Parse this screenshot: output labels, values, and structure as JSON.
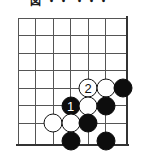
{
  "diagram": {
    "kind": "go-board-problem-diagram",
    "caption": "図 ・・ ・・・",
    "board": {
      "columns": 7,
      "rows": 8,
      "cell_size": 17.5,
      "origin_x": 18,
      "origin_y": 10,
      "line_color": "#555555",
      "edge_color": "#333333",
      "background": "#ffffff"
    },
    "colors": {
      "black_stone": "#0d0d0d",
      "white_stone": "#ffffff",
      "stone_outline": "#111111",
      "black_label_text": "#ffffff",
      "white_label_text": "#111111"
    },
    "stones": [
      {
        "name": "white-move-2",
        "color": "white",
        "col": 4,
        "row": 4,
        "label": "2"
      },
      {
        "name": "white-stone-c5r4",
        "color": "white",
        "col": 5,
        "row": 4,
        "label": ""
      },
      {
        "name": "black-stone-c6r4",
        "color": "black",
        "col": 6,
        "row": 4,
        "label": ""
      },
      {
        "name": "black-move-1",
        "color": "black",
        "col": 3,
        "row": 5,
        "label": "1"
      },
      {
        "name": "white-stone-c4r5",
        "color": "white",
        "col": 4,
        "row": 5,
        "label": ""
      },
      {
        "name": "black-stone-c5r5",
        "color": "black",
        "col": 5,
        "row": 5,
        "label": ""
      },
      {
        "name": "white-stone-c2r6",
        "color": "white",
        "col": 2,
        "row": 6,
        "label": ""
      },
      {
        "name": "white-stone-c3r6",
        "color": "white",
        "col": 3,
        "row": 6,
        "label": ""
      },
      {
        "name": "black-stone-c4r6",
        "color": "black",
        "col": 4,
        "row": 6,
        "label": ""
      },
      {
        "name": "black-stone-c3r7",
        "color": "black",
        "col": 3,
        "row": 7,
        "label": ""
      },
      {
        "name": "black-stone-c5r7",
        "color": "black",
        "col": 5,
        "row": 7,
        "label": ""
      }
    ],
    "move_numbers": [
      "1",
      "2"
    ]
  }
}
